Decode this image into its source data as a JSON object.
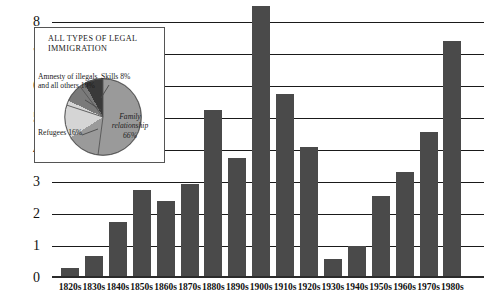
{
  "chart_data": {
    "type": "bar",
    "title": "",
    "xlabel": "",
    "ylabel": "",
    "ylim": [
      0,
      8
    ],
    "grid": true,
    "categories": [
      "1820s",
      "1830s",
      "1840s",
      "1850s",
      "1860s",
      "1870s",
      "1880s",
      "1890s",
      "1900s",
      "1910s",
      "1920s",
      "1930s",
      "1940s",
      "1950s",
      "1960s",
      "1970s",
      "1980s"
    ],
    "values": [
      0.3,
      0.7,
      1.75,
      2.75,
      2.4,
      2.95,
      5.25,
      3.75,
      8.5,
      5.75,
      4.1,
      0.6,
      1.0,
      2.55,
      3.3,
      4.55,
      7.4
    ],
    "y_ticks": [
      "0",
      "1",
      "2",
      "3",
      "4",
      "5",
      "6",
      "7",
      "8"
    ],
    "series_name": "Legal immigrants (millions)",
    "bar_color": "#4a4a4a",
    "gridline_color": "#1a1a1a",
    "background_color": "#ffffff"
  },
  "inset": {
    "title": "ALL TYPES OF LEGAL IMMIGRATION",
    "pie": {
      "type": "pie",
      "slices": [
        {
          "label": "Family relationship",
          "percent": 66,
          "value_text": "Family relationship 66%",
          "color": "#9a9a9a"
        },
        {
          "label": "Refugees",
          "percent": 16,
          "value_text": "Refugees 16%",
          "color": "#d5d5d5"
        },
        {
          "label": "Amnesty of illegals and all others",
          "percent": 10,
          "value_text": "Amnesty of illegals and all others 10%",
          "color": "#7a7a7a"
        },
        {
          "label": "Skills",
          "percent": 8,
          "value_text": "Skills 8%",
          "color": "#3a3a3a"
        }
      ]
    },
    "labels": {
      "amnesty": "Amnesty of illegals and all others 10%",
      "refugees": "Refugees 16%",
      "skills": "Skills 8%",
      "family": "Family relationship 66%"
    }
  }
}
